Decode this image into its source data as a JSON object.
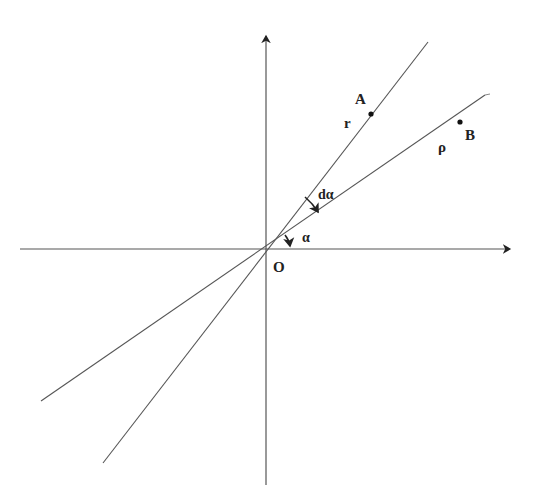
{
  "diagram": {
    "type": "geometry",
    "origin_label": "O",
    "points": [
      {
        "id": "A",
        "label": "A",
        "on_ray": "r"
      },
      {
        "id": "B",
        "label": "B",
        "on_ray": "rho"
      }
    ],
    "ray_labels": {
      "r": "r",
      "rho": "ρ"
    },
    "angle_labels": {
      "alpha": "α",
      "dalpha": "dα"
    },
    "colors": {
      "line": "#555555",
      "axis": "#444444",
      "text": "#222222",
      "background": "#ffffff"
    }
  }
}
